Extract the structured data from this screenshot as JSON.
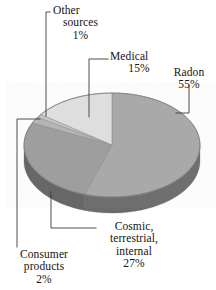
{
  "chart_data": {
    "type": "pie",
    "title": "",
    "subtitle": "",
    "xlabel": "",
    "ylabel": "",
    "style": "3d-exploded-none grayscale print halftone",
    "legend_position": "none (direct labels with leader lines)",
    "grid": false,
    "categories": [
      "Radon",
      "Cosmic, terrestrial, internal",
      "Medical",
      "Consumer products",
      "Other sources"
    ],
    "values": [
      55,
      27,
      15,
      2,
      1
    ],
    "value_unit": "%",
    "slices": [
      {
        "name": "Radon",
        "label_lines": [
          "Radon"
        ],
        "percent_text": "55%",
        "value": 55,
        "top_color": "#a9a9a9",
        "side_color": "#6b6b6b"
      },
      {
        "name": "Cosmic, terrestrial, internal",
        "label_lines": [
          "Cosmic,",
          "terrestrial,",
          "internal"
        ],
        "percent_text": "27%",
        "value": 27,
        "top_color": "#9e9e9e",
        "side_color": "#636363"
      },
      {
        "name": "Medical",
        "label_lines": [
          "Medical"
        ],
        "percent_text": "15%",
        "value": 15,
        "top_color": "#dedede",
        "side_color": "#9a9a9a"
      },
      {
        "name": "Consumer products",
        "label_lines": [
          "Consumer",
          "products"
        ],
        "percent_text": "2%",
        "value": 2,
        "top_color": "#b4b4b4",
        "side_color": "#707070"
      },
      {
        "name": "Other sources",
        "label_lines": [
          "Other",
          "sources"
        ],
        "percent_text": "1%",
        "value": 1,
        "top_color": "#c8c8c8",
        "side_color": "#7d7d7d"
      }
    ]
  },
  "figure": {
    "background_color": "#ffffff",
    "text_color": "#141414",
    "leader_line_color": "#3a3a3a"
  },
  "labels": {
    "other": {
      "line1": "Other",
      "line2": "sources",
      "pct": "1%"
    },
    "medical": {
      "line1": "Medical",
      "pct": "15%"
    },
    "radon": {
      "line1": "Radon",
      "pct": "55%"
    },
    "cosmic": {
      "line1": "Cosmic,",
      "line2": "terrestrial,",
      "line3": "internal",
      "pct": "27%"
    },
    "consumer": {
      "line1": "Consumer",
      "line2": "products",
      "pct": "2%"
    }
  }
}
